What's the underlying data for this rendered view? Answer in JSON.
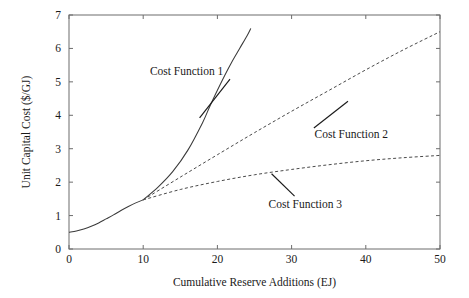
{
  "chart_data": {
    "type": "line",
    "title": "",
    "xlabel": "Cumulative Reserve Additions (EJ)",
    "ylabel": "Unit Capital Cost ($/GJ)",
    "xlim": [
      0,
      50
    ],
    "ylim": [
      0,
      7
    ],
    "xticks": [
      0,
      10,
      20,
      30,
      40,
      50
    ],
    "yticks": [
      0,
      1,
      2,
      3,
      4,
      5,
      6,
      7
    ],
    "xtick_labels": [
      "0",
      "10",
      "20",
      "30",
      "40",
      "50"
    ],
    "ytick_labels": [
      "0",
      "1",
      "2",
      "3",
      "4",
      "5",
      "6",
      "7"
    ],
    "grid": false,
    "legend": "none",
    "branch_point": {
      "x": 10,
      "y": 1.47
    },
    "series": [
      {
        "name": "Common Base",
        "style": "solid",
        "x": [
          0,
          1,
          2,
          3,
          4,
          5,
          6,
          7,
          8,
          9,
          10
        ],
        "y": [
          0.5,
          0.54,
          0.6,
          0.68,
          0.78,
          0.9,
          1.02,
          1.15,
          1.27,
          1.38,
          1.47
        ]
      },
      {
        "name": "Cost Function 1",
        "style": "solid",
        "x": [
          10,
          12,
          14,
          16,
          18,
          19,
          20,
          21,
          22,
          23,
          24,
          24.5
        ],
        "y": [
          1.47,
          1.85,
          2.32,
          2.95,
          3.78,
          4.28,
          4.75,
          5.2,
          5.62,
          6.0,
          6.38,
          6.6
        ]
      },
      {
        "name": "Cost Function 2",
        "style": "dashed",
        "x": [
          10,
          15,
          20,
          25,
          30,
          35,
          40,
          45,
          50
        ],
        "y": [
          1.47,
          2.15,
          2.82,
          3.48,
          4.12,
          4.74,
          5.36,
          5.95,
          6.5
        ]
      },
      {
        "name": "Cost Function 3",
        "style": "dashed",
        "x": [
          10,
          15,
          20,
          25,
          30,
          35,
          40,
          45,
          50
        ],
        "y": [
          1.47,
          1.78,
          2.02,
          2.22,
          2.38,
          2.52,
          2.64,
          2.73,
          2.8
        ]
      }
    ],
    "annotations": [
      {
        "text": "Cost Function 1",
        "label_x": 10.9,
        "label_y": 5.32,
        "leader_from": {
          "x": 21.7,
          "y": 5.08
        },
        "leader_to": {
          "x": 17.6,
          "y": 3.92
        }
      },
      {
        "text": "Cost Function 2",
        "label_x": 33.1,
        "label_y": 3.43,
        "leader_from": {
          "x": 33.0,
          "y": 3.62
        },
        "leader_to": {
          "x": 37.6,
          "y": 4.42
        }
      },
      {
        "text": "Cost Function 3",
        "label_x": 26.9,
        "label_y": 1.36,
        "leader_from": {
          "x": 30.4,
          "y": 1.58
        },
        "leader_to": {
          "x": 27.3,
          "y": 2.25
        }
      }
    ]
  }
}
